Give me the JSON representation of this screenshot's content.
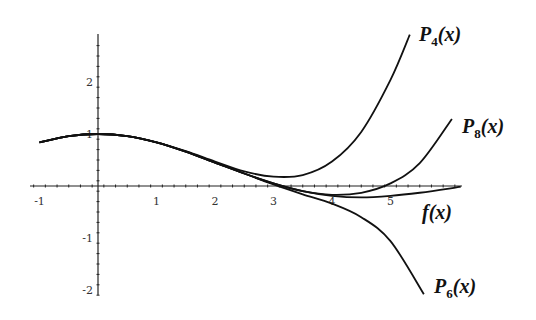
{
  "chart_data": {
    "type": "line",
    "title": "",
    "xlabel": "",
    "ylabel": "",
    "xlim": [
      -1,
      6.2
    ],
    "ylim": [
      -2.1,
      2.9
    ],
    "grid": false,
    "x_ticks": [
      -1,
      1,
      2,
      3,
      4,
      5
    ],
    "x_tick_labels": [
      "-1",
      "1",
      "2",
      "3",
      "4",
      "5"
    ],
    "y_ticks": [
      2,
      1,
      -1,
      -2
    ],
    "y_tick_labels": [
      "2",
      "1",
      "-1",
      "-2"
    ],
    "series": [
      {
        "name": "f(x)",
        "label_main": "f(x)",
        "label_sub": "",
        "x": [
          -1,
          -0.5,
          0,
          0.5,
          1,
          1.5,
          2,
          2.5,
          3,
          3.5,
          4,
          4.5,
          5,
          5.5,
          6,
          6.2
        ],
        "values": [
          0.84,
          0.96,
          1.0,
          0.96,
          0.84,
          0.66,
          0.45,
          0.24,
          0.05,
          -0.1,
          -0.19,
          -0.22,
          -0.19,
          -0.13,
          -0.05,
          -0.01
        ]
      },
      {
        "name": "P4(x)",
        "label_main": "P",
        "label_sub": "4",
        "label_tail": "(x)",
        "x": [
          -1,
          -0.5,
          0,
          0.5,
          1,
          1.5,
          2,
          2.5,
          3,
          3.5,
          4,
          4.5,
          5,
          5.33
        ],
        "values": [
          0.84,
          0.96,
          1.0,
          0.96,
          0.84,
          0.67,
          0.47,
          0.28,
          0.18,
          0.21,
          0.47,
          1.04,
          2.04,
          2.91
        ]
      },
      {
        "name": "P6(x)",
        "label_main": "P",
        "label_sub": "6",
        "label_tail": "(x)",
        "x": [
          -1,
          -0.5,
          0,
          0.5,
          1,
          1.5,
          2,
          2.5,
          3,
          3.5,
          4,
          4.5,
          5,
          5.57
        ],
        "values": [
          0.84,
          0.96,
          1.0,
          0.96,
          0.84,
          0.66,
          0.45,
          0.24,
          0.03,
          -0.16,
          -0.34,
          -0.6,
          -1.06,
          -2.08
        ]
      },
      {
        "name": "P8(x)",
        "label_main": "P",
        "label_sub": "8",
        "label_tail": "(x)",
        "x": [
          -1,
          -0.5,
          0,
          0.5,
          1,
          1.5,
          2,
          2.5,
          3,
          3.5,
          4,
          4.5,
          5,
          5.5,
          6.05
        ],
        "values": [
          0.84,
          0.96,
          1.0,
          0.96,
          0.84,
          0.66,
          0.45,
          0.24,
          0.05,
          -0.1,
          -0.17,
          -0.13,
          0.05,
          0.44,
          1.29
        ]
      }
    ]
  }
}
